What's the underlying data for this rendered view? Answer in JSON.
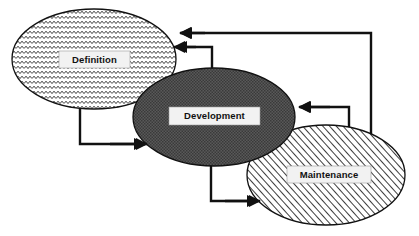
{
  "diagram": {
    "background_color": "#ffffff",
    "line_color": "#111111",
    "label_box_color": "#f2f2f2",
    "nodes": [
      {
        "id": "definition",
        "label": "Definition",
        "shape": "ellipse",
        "fill_pattern": "wavy-zigzag",
        "fill_color": "#ffffff",
        "pattern_color": "#1a1a1a",
        "cx": 94,
        "cy": 59,
        "rx": 82,
        "ry": 50,
        "label_x": 94,
        "label_y": 59
      },
      {
        "id": "development",
        "label": "Development",
        "shape": "ellipse",
        "fill_pattern": "dense-dotted-dark",
        "fill_color": "#595959",
        "pattern_color": "#2e2e2e",
        "cx": 214,
        "cy": 117,
        "rx": 81,
        "ry": 49,
        "label_x": 214,
        "label_y": 115
      },
      {
        "id": "maintenance",
        "label": "Maintenance",
        "shape": "ellipse",
        "fill_pattern": "diagonal-hatch",
        "fill_color": "#ffffff",
        "pattern_color": "#1a1a1a",
        "cx": 326,
        "cy": 175,
        "rx": 79,
        "ry": 50,
        "label_x": 329,
        "label_y": 174
      }
    ],
    "connectors": [
      {
        "id": "definition-to-development",
        "from": "definition",
        "to": "development",
        "direction": "forward",
        "description": "Definition bottom down and right into Development left"
      },
      {
        "id": "development-to-maintenance",
        "from": "development",
        "to": "maintenance",
        "direction": "forward",
        "description": "Development bottom down and right into Maintenance left"
      },
      {
        "id": "development-to-definition",
        "from": "development",
        "to": "definition",
        "direction": "feedback",
        "description": "Development top up and left into Definition right"
      },
      {
        "id": "maintenance-to-development",
        "from": "maintenance",
        "to": "development",
        "direction": "feedback",
        "description": "Maintenance top up and left into Development right"
      },
      {
        "id": "maintenance-to-definition",
        "from": "maintenance",
        "to": "definition",
        "direction": "feedback",
        "description": "Maintenance far right up and long left into Definition right"
      }
    ]
  }
}
